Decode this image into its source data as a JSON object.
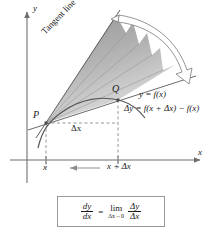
{
  "figure": {
    "axes": {
      "y_label": "y",
      "x_label": "x"
    },
    "points": {
      "p_label": "P",
      "q_label": "Q"
    },
    "annotations": {
      "tangent_line": "Tangent line",
      "curve_label": "y = f(x)",
      "delta_y": "Δy = f(x + Δx) − f(x)",
      "delta_x": "Δx"
    },
    "ticks": {
      "x_tick": "x",
      "x_plus_dx_tick": "x + Δx"
    },
    "formula": {
      "lhs_num": "dy",
      "lhs_den": "dx",
      "equals": "=",
      "limit_word": "lim",
      "limit_sub": "Δx→0",
      "rhs_num": "Δy",
      "rhs_den": "Δx"
    },
    "colors": {
      "axis": "#6e6e6e",
      "curve": "#5b5b5b",
      "secant": "#6b6b6b",
      "dashed": "#8a8a8a",
      "fan_dark": "#9a9a9a",
      "fan_light": "#d8d8d8",
      "arrow_outline": "#7a7a7a",
      "text": "#1a1a1a",
      "box_border": "#9a9a9a",
      "background": "#ffffff"
    }
  }
}
